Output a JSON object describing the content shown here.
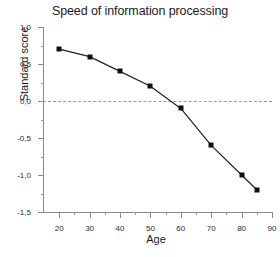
{
  "chart_data": {
    "type": "line",
    "title": "Speed of information processing",
    "xlabel": "Age",
    "ylabel": "Standard score",
    "x": [
      20,
      30,
      40,
      50,
      60,
      70,
      80,
      85
    ],
    "values": [
      0.7,
      0.6,
      0.4,
      0.2,
      -0.1,
      -0.6,
      -1.0,
      -1.2
    ],
    "series": [
      {
        "name": "Speed of information processing",
        "x": [
          20,
          30,
          40,
          50,
          60,
          70,
          80,
          85
        ],
        "values": [
          0.7,
          0.6,
          0.4,
          0.2,
          -0.1,
          -0.6,
          -1.0,
          -1.2
        ]
      }
    ],
    "xlim": [
      15,
      90
    ],
    "ylim": [
      -1.5,
      1.0
    ],
    "xticks": [
      20,
      30,
      40,
      50,
      60,
      70,
      80,
      90
    ],
    "xtick_labels": [
      "20",
      "30",
      "40",
      "50",
      "60",
      "70",
      "80",
      "90"
    ],
    "xminor_ticks": [
      25,
      35,
      45,
      55,
      65,
      75,
      85
    ],
    "yticks": [
      1.0,
      0.5,
      0.0,
      -0.5,
      -1.0,
      -1.5
    ],
    "ytick_labels": [
      "1,0",
      "0,5",
      "0,0",
      "-0,5",
      "-1,0",
      "-1,5"
    ],
    "yminor_ticks": [
      0.75,
      0.25,
      -0.25,
      -0.75,
      -1.25
    ],
    "grid": false,
    "legend": null,
    "annotations": [
      {
        "name": "zero-reference-line",
        "type": "hline",
        "y": 0.0,
        "style": "dashed",
        "color": "#9b9b9b"
      }
    ],
    "colors": {
      "line": "#222222",
      "marker": "#111111",
      "axis": "#8a8a8a",
      "text": "#1a1a1a",
      "background": "#ffffff"
    },
    "marker_style": "square"
  }
}
